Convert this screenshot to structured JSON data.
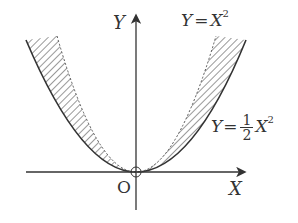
{
  "diagram": {
    "axes": {
      "x_label": "X",
      "y_label": "Y",
      "origin_label": "O"
    },
    "curves": [
      {
        "name": "Y = X^2",
        "style": "dashed",
        "label_var": "Y",
        "label_eq": "=",
        "label_rhs": "X",
        "label_exp": "2"
      },
      {
        "name": "Y = 1/2 X^2",
        "style": "solid",
        "label_var": "Y",
        "label_eq": "=",
        "label_num": "1",
        "label_den": "2",
        "label_rhs": "X",
        "label_exp": "2"
      }
    ],
    "shading": "hatched region between the two curves",
    "colors": {
      "ink": "#333333",
      "background": "#ffffff"
    }
  }
}
